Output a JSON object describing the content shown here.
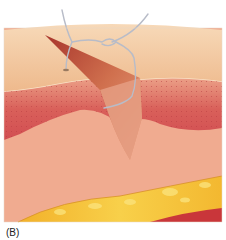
{
  "figure": {
    "label": "(B)",
    "colors": {
      "epidermis": "#f2c59a",
      "epidermis_light": "#f6d3ad",
      "dermis_red": "#d9605a",
      "dermis_pink": "#eea592",
      "subcutis": "#f0a88c",
      "fat_yellow": "#f5c030",
      "fat_orange": "#e89a20",
      "muscle_red": "#c9363a",
      "flap": "#c85a45",
      "suture": "#b8bcc8"
    }
  }
}
